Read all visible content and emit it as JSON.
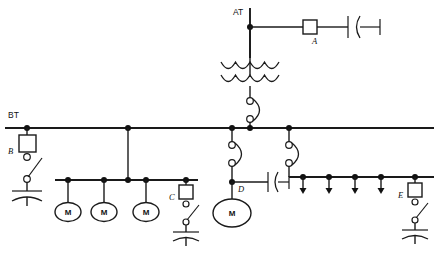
{
  "diagram": {
    "type": "single-line-diagram",
    "colors": {
      "line": "#1a1a1a",
      "node": "#111111",
      "background": "#ffffff",
      "fill": "#ffffff"
    },
    "buses": [
      {
        "id": "AT",
        "label": "AT",
        "orientation": "vertical",
        "label_x": 233,
        "label_y": 15
      },
      {
        "id": "BT",
        "label": "BT",
        "orientation": "horizontal",
        "label_x": 8,
        "label_y": 118
      }
    ],
    "device_labels": {
      "a": "A",
      "b": "B",
      "c": "C",
      "d": "D",
      "e": "E"
    },
    "machine_label": "M",
    "machines": [
      {
        "id": "m1",
        "label": "M",
        "cx": 68,
        "cy": 212,
        "rx": 13,
        "ry": 9.5
      },
      {
        "id": "m2",
        "label": "M",
        "cx": 104,
        "cy": 212,
        "rx": 13,
        "ry": 9.5
      },
      {
        "id": "m3",
        "label": "M",
        "cx": 146,
        "cy": 212,
        "rx": 13,
        "ry": 9.5
      },
      {
        "id": "m4",
        "label": "M",
        "cx": 232,
        "cy": 213,
        "rx": 19,
        "ry": 14
      }
    ],
    "capacitor_banks": [
      {
        "id": "cap-b",
        "device": "B",
        "label": "B"
      },
      {
        "id": "cap-c",
        "device": "C",
        "label": "C"
      },
      {
        "id": "cap-e",
        "device": "E",
        "label": "E"
      }
    ],
    "load_feeders": {
      "count": 5,
      "symbol": "down-arrow",
      "x_positions": [
        303,
        329,
        355,
        381,
        415
      ]
    },
    "transformer": {
      "windings": 2,
      "arcs_per_winding": 4,
      "label": ""
    },
    "breakers": {
      "count": 3,
      "symbol": "drawout-circles-with-arc"
    },
    "disconnects": {
      "count": 2,
      "symbol": "bar-arc-stub"
    },
    "switches": {
      "count": 3,
      "symbol": "knife-switch"
    }
  }
}
